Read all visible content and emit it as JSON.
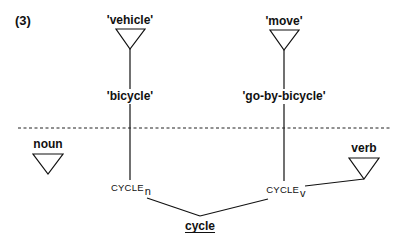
{
  "example_number": "(3)",
  "top_nodes": {
    "left_semantic_feature": "'vehicle'",
    "right_semantic_feature": "'move'"
  },
  "senses": {
    "left": "'bicycle'",
    "right": "'go-by-bicycle'"
  },
  "syntactic_categories": {
    "left": "noun",
    "right": "verb"
  },
  "lexemes": {
    "left_base": "CYCLE",
    "left_subscript": "n",
    "right_base": "CYCLE",
    "right_subscript": "v"
  },
  "word_form": "cycle",
  "divider": "dashed horizontal line separating semantic level (above) from syntactic level (below)",
  "colors": {
    "ink": "#111111",
    "background": "#ffffff"
  }
}
